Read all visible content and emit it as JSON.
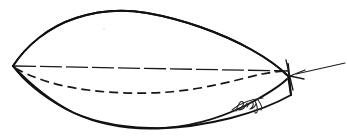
{
  "image": {
    "title": "Hand-drawn boat hull profile sketch",
    "width": 347,
    "height": 139,
    "background_color": "#ffffff",
    "ink_color": "#111111"
  },
  "drawing": {
    "subject": "boat hull side/plan view outline",
    "medium": "pen line drawing on white paper",
    "elements": [
      {
        "name": "deck-sheer-line",
        "label": "Upper hull outline (deck / sheer line)",
        "style": "solid",
        "path": "M 13,66 C 26,46 48,27 76,18 C 100,10 124,9 147,13 C 181,19 220,32 252,50 C 268,59 280,68 287,75"
      },
      {
        "name": "bottom-hull-line",
        "label": "Lower hull outline (keel / bottom)",
        "style": "solid",
        "path": "M 13,66 C 28,82 50,101 74,113 C 104,127 136,130 166,128 C 200,125 231,114 256,100 C 272,91 282,84 287,79"
      },
      {
        "name": "transom-line",
        "label": "Transom (vertical stern edge)",
        "style": "solid",
        "path": "M 288,64 L 291,95"
      },
      {
        "name": "centerline",
        "label": "Dashed centerline",
        "style": "dashed-long",
        "path": "M 14,66 L 288,71"
      },
      {
        "name": "chine-waterline",
        "label": "Dashed chine / waterline curve",
        "style": "dashed-short",
        "path": "M 15,68 C 34,78 58,86 90,90 C 130,95 175,93 213,85 C 243,79 268,73 288,72"
      },
      {
        "name": "stern-arrow",
        "label": "Leader arrow pointing to transom",
        "style": "arrow",
        "direction": "points left-down toward stern",
        "path": "M 344,64 L 292,75"
      },
      {
        "name": "handwritten-annotation",
        "label": "Small handwritten initials near hull bottom",
        "style": "script",
        "approx_text": "flqL"
      }
    ],
    "labels": [],
    "annotations": [
      {
        "name": "handwritten-initials",
        "text": "",
        "position": "lower hull, right of center"
      }
    ]
  }
}
